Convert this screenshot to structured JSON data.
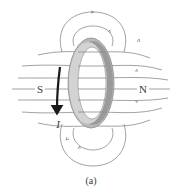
{
  "figure": {
    "caption": "(a)",
    "labels": {
      "south": "S",
      "north": "N",
      "current": "I"
    },
    "colors": {
      "field_line": "#8a8a8a",
      "ring_face": "#b9b9b9",
      "ring_edge": "#8d8d8d",
      "ring_highlight": "#d6d6d6",
      "current_arrow": "#1a1a1a",
      "text": "#3a3a3a"
    },
    "elements": {
      "ring": "current-carrying loop",
      "axis": "horizontal axis through loop center",
      "field_lines_top": 2,
      "field_lines_bottom": 2,
      "field_lines_through_loop": 7
    }
  }
}
